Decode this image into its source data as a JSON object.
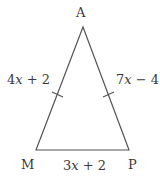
{
  "figure": {
    "type": "isosceles-triangle",
    "stroke_color": "#555555",
    "text_color": "#3a3a3a",
    "background": "#ffffff"
  },
  "vertices": {
    "top": {
      "label": "A"
    },
    "bottom_left": {
      "label": "M"
    },
    "bottom_right": {
      "label": "P"
    }
  },
  "sides": {
    "AM": {
      "coef": "4",
      "var": "x",
      "rest": " + 2",
      "tick_marks": 1
    },
    "AP": {
      "coef": "7",
      "var": "x",
      "rest": " − 4",
      "tick_marks": 1
    },
    "MP": {
      "coef": "3",
      "var": "x",
      "rest": " + 2",
      "tick_marks": 0
    }
  }
}
